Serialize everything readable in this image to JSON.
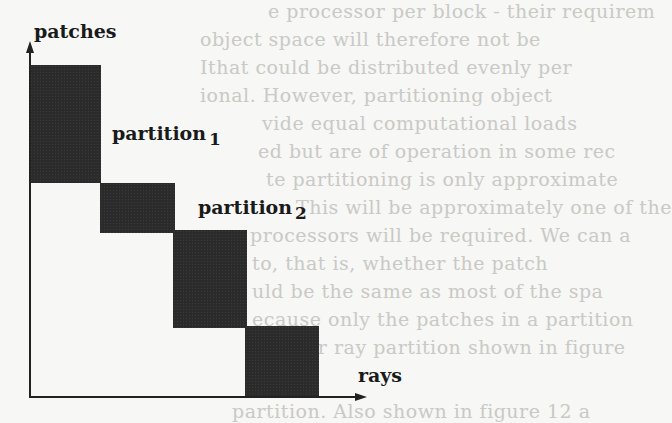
{
  "diagram": {
    "axes": {
      "y_label": "patches",
      "x_label": "rays"
    },
    "partitions": [
      {
        "label": "partition",
        "subscript": "1"
      },
      {
        "label": "partition",
        "subscript": "2"
      }
    ],
    "blocks": [
      {
        "name": "block-1",
        "x": 30,
        "y": 65,
        "w": 71,
        "h": 118
      },
      {
        "name": "block-2",
        "x": 100,
        "y": 183,
        "w": 75,
        "h": 50
      },
      {
        "name": "block-3",
        "x": 173,
        "y": 230,
        "w": 74,
        "h": 98
      },
      {
        "name": "block-4",
        "x": 245,
        "y": 326,
        "w": 74,
        "h": 71
      }
    ],
    "colors": {
      "block": "#2b2b2b",
      "axis": "#222222",
      "background": "#f7f7f5",
      "bleed_text": "#c9c9c6"
    }
  },
  "bleed_through_text": [
    "e processor per block - their requirem",
    "object space will therefore not be",
    "Ithat could be distributed evenly per",
    "ional. However, partitioning object",
    "vide equal computational loads",
    "ed but are of operation in some rec",
    "te partitioning is only approximate",
    "This will be approximately one of the",
    "processors will be required. We can a",
    "to, that is, whether the patch",
    "uld be the same as most of the spa",
    "ecause only the patches in a partition",
    "ove per ray partition shown in figure",
    "partition. Also shown in figure 12 a"
  ]
}
